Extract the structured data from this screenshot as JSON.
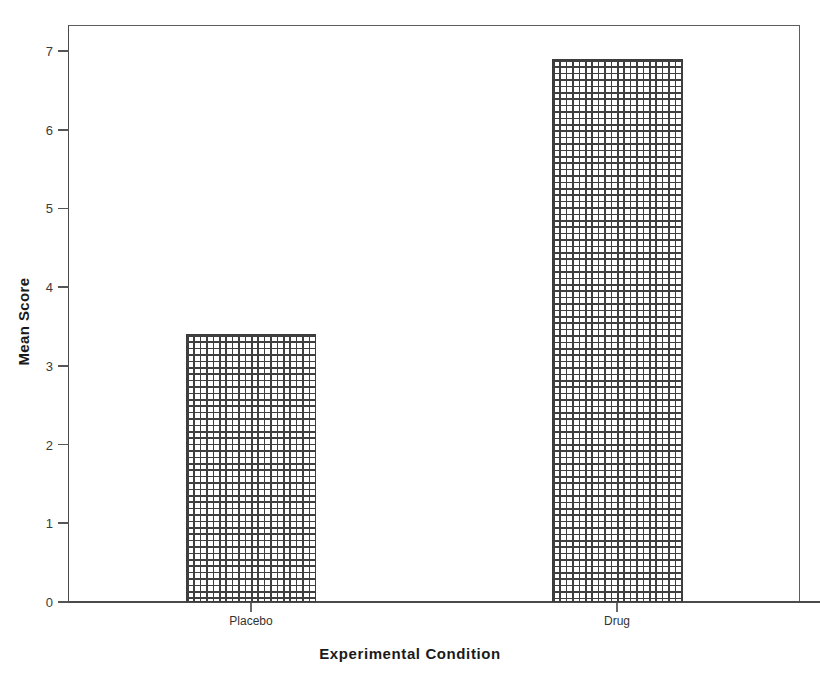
{
  "chart_data": {
    "type": "bar",
    "title": "",
    "xlabel": "Experimental Condition",
    "ylabel": "Mean Score",
    "categories": [
      "Placebo",
      "Drug"
    ],
    "values": [
      3.4,
      6.9
    ],
    "ylim": [
      0,
      7
    ],
    "yticks": [
      0,
      1,
      2,
      3,
      4,
      5,
      6,
      7
    ],
    "ytick_labels": [
      "0",
      "1",
      "2",
      "3",
      "4",
      "5",
      "6",
      "7"
    ],
    "grid": false,
    "legend": null,
    "bar_fill": "crosshatch",
    "bar_edge_color": "#3c3c3c",
    "axis_color": "#4a4a4a",
    "background_color": "#ffffff"
  },
  "axis": {
    "y_title": "Mean Score",
    "x_title": "Experimental Condition"
  }
}
